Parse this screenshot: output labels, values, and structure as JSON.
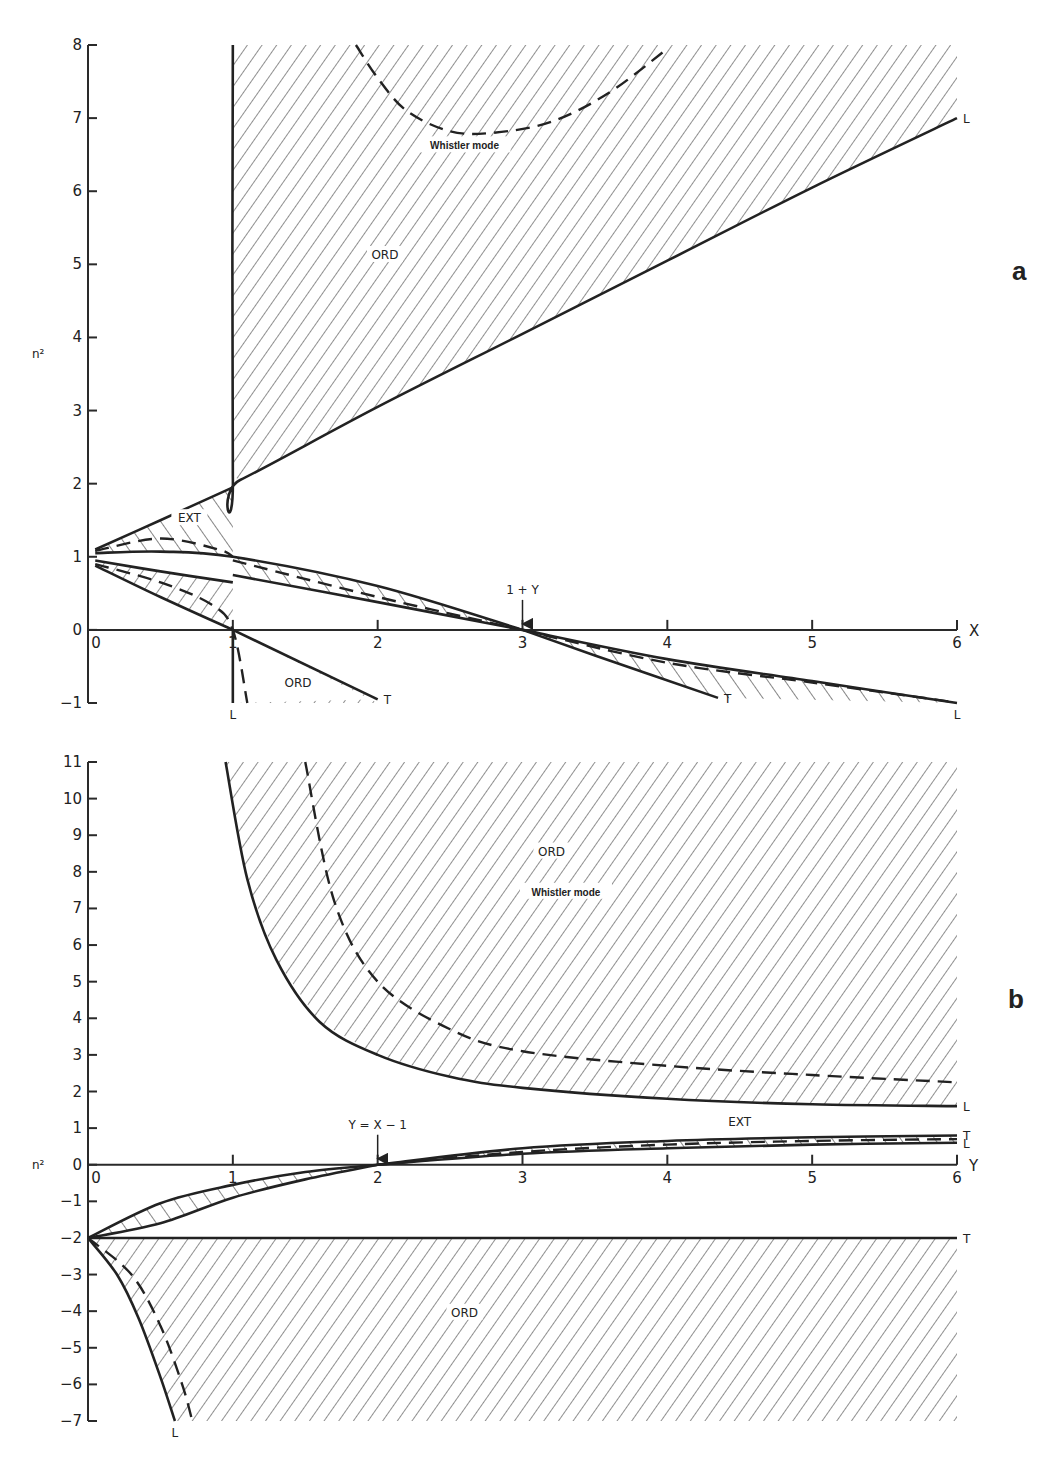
{
  "chart_data": [
    {
      "panel": "a",
      "type": "line",
      "xlabel": "X",
      "ylabel": "n²",
      "xlim": [
        0,
        6
      ],
      "ylim": [
        -1,
        8
      ],
      "x_ticks": [
        "0",
        "1",
        "2",
        "3",
        "4",
        "5",
        "6"
      ],
      "y_ticks": [
        "-1",
        "0",
        "1",
        "2",
        "3",
        "4",
        "5",
        "6",
        "7",
        "8"
      ],
      "grid": false,
      "annotations": [
        {
          "text": "1+Y",
          "x": 3,
          "y": 0,
          "arrow": true
        },
        {
          "text": "Whistler mode",
          "x": 2.6,
          "y": 6.6
        },
        {
          "text": "ORD",
          "x": 2.05,
          "y": 5.1
        },
        {
          "text": "EXT",
          "x": 0.7,
          "y": 1.5
        },
        {
          "text": "ORD",
          "x": 1.45,
          "y": -0.75
        }
      ],
      "series": [
        {
          "name": "ORD whistler lower boundary (L)",
          "style": "solid",
          "end_label": "L",
          "x": [
            1.0,
            1.0,
            1.05,
            2,
            3,
            4,
            5,
            6
          ],
          "y": [
            8,
            2.1,
            2.05,
            3.05,
            4.05,
            5.05,
            6.05,
            7.0
          ]
        },
        {
          "name": "ORD whistler dashed",
          "style": "dashed",
          "x": [
            1.85,
            2.0,
            2.2,
            2.5,
            2.8,
            3.2,
            3.6,
            4.0
          ],
          "y": [
            8.0,
            7.55,
            7.1,
            6.82,
            6.8,
            6.95,
            7.35,
            7.95
          ]
        },
        {
          "name": "EXT upper (X<1)",
          "style": "solid",
          "x": [
            0.05,
            0.5,
            1.0
          ],
          "y": [
            1.1,
            1.5,
            1.95
          ]
        },
        {
          "name": "EXT dashed (X<1)",
          "style": "dashed",
          "x": [
            0.05,
            0.5,
            0.9,
            1.0
          ],
          "y": [
            1.08,
            1.25,
            1.1,
            1.0
          ]
        },
        {
          "name": "Upper branch solid lower",
          "style": "solid",
          "x": [
            0.05,
            0.5,
            1.0,
            2.0,
            3.0
          ],
          "y": [
            1.05,
            1.07,
            1.0,
            0.6,
            0.0
          ]
        },
        {
          "name": "Upper branch dashed",
          "style": "dashed",
          "x": [
            1.0,
            2.0,
            3.0
          ],
          "y": [
            0.95,
            0.45,
            0.0
          ]
        },
        {
          "name": "Lower branch solid (X<1)",
          "style": "solid",
          "x": [
            0.05,
            0.5,
            1.0
          ],
          "y": [
            0.95,
            0.8,
            0.65
          ]
        },
        {
          "name": "Lower solid after X=1",
          "style": "solid",
          "x": [
            1.0,
            2.0,
            3.0
          ],
          "y": [
            0.75,
            0.38,
            0.0
          ]
        },
        {
          "name": "ORD lower branch solid",
          "style": "solid",
          "x": [
            0.05,
            0.5,
            1.0
          ],
          "y": [
            0.88,
            0.45,
            0.0
          ]
        },
        {
          "name": "ORD lower dashed",
          "style": "dashed",
          "x": [
            0.05,
            0.5,
            0.85,
            1.0,
            1.1
          ],
          "y": [
            0.9,
            0.65,
            0.35,
            0.0,
            -1.0
          ]
        },
        {
          "name": "ORD X>1 (T)",
          "style": "solid",
          "end_label": "T",
          "x": [
            1.0,
            2.0
          ],
          "y": [
            0.0,
            -0.95
          ]
        },
        {
          "name": "Vertical L at X=1",
          "style": "solid",
          "end_label": "L",
          "x": [
            1.0,
            1.0
          ],
          "y": [
            0.0,
            -1.0
          ]
        },
        {
          "name": "EXT X>3 upper (L)",
          "style": "solid",
          "end_label": "L",
          "x": [
            3.0,
            4.0,
            5.0,
            6.0
          ],
          "y": [
            0.0,
            -0.4,
            -0.7,
            -1.0
          ]
        },
        {
          "name": "EXT X>3 dashed",
          "style": "dashed",
          "x": [
            3.0,
            4.0,
            5.0,
            5.95
          ],
          "y": [
            0.0,
            -0.45,
            -0.72,
            -0.98
          ]
        },
        {
          "name": "EXT X>3 lower (T)",
          "style": "solid",
          "end_label": "T",
          "x": [
            3.0,
            3.5,
            4.35
          ],
          "y": [
            0.0,
            -0.35,
            -0.93
          ]
        }
      ]
    },
    {
      "panel": "b",
      "type": "line",
      "xlabel": "Y",
      "ylabel": "n²",
      "xlim": [
        0,
        6
      ],
      "ylim": [
        -7,
        11
      ],
      "x_ticks": [
        "0",
        "1",
        "2",
        "3",
        "4",
        "5",
        "6"
      ],
      "y_ticks": [
        "-7",
        "-6",
        "-5",
        "-4",
        "-3",
        "-2",
        "-1",
        "0",
        "1",
        "2",
        "3",
        "4",
        "5",
        "6",
        "7",
        "8",
        "9",
        "10",
        "11"
      ],
      "grid": false,
      "annotations": [
        {
          "text": "Y=X-1",
          "x": 2,
          "y": 0,
          "arrow": true
        },
        {
          "text": "ORD",
          "x": 3.2,
          "y": 8.5
        },
        {
          "text": "Whistler mode",
          "x": 3.3,
          "y": 7.4
        },
        {
          "text": "EXT",
          "x": 4.5,
          "y": 1.1
        },
        {
          "text": "ORD",
          "x": 2.6,
          "y": -4.1
        }
      ],
      "series": [
        {
          "name": "ORD whistler solid (L)",
          "style": "solid",
          "end_label": "L",
          "x": [
            0.95,
            1.1,
            1.3,
            1.6,
            2.0,
            2.5,
            3.0,
            4.0,
            5.0,
            6.0
          ],
          "y": [
            11,
            7.8,
            5.6,
            3.9,
            3.0,
            2.4,
            2.1,
            1.8,
            1.65,
            1.6
          ]
        },
        {
          "name": "ORD whistler dashed",
          "style": "dashed",
          "x": [
            1.5,
            1.7,
            2.0,
            2.5,
            3.0,
            4.0,
            5.0,
            6.0
          ],
          "y": [
            11,
            7.2,
            5.0,
            3.7,
            3.1,
            2.7,
            2.45,
            2.25
          ]
        },
        {
          "name": "EXT upper (T)",
          "style": "solid",
          "end_label": "T",
          "x": [
            2.0,
            3.0,
            4.0,
            5.0,
            6.0
          ],
          "y": [
            0.0,
            0.45,
            0.65,
            0.75,
            0.8
          ]
        },
        {
          "name": "EXT dashed",
          "style": "dashed",
          "x": [
            2.0,
            3.0,
            4.0,
            5.0,
            6.0
          ],
          "y": [
            0.0,
            0.35,
            0.55,
            0.65,
            0.7
          ]
        },
        {
          "name": "EXT lower (L)",
          "style": "solid",
          "end_label": "L",
          "x": [
            2.0,
            3.0,
            4.0,
            5.0,
            6.0
          ],
          "y": [
            0.0,
            0.3,
            0.45,
            0.55,
            0.6
          ]
        },
        {
          "name": "Y<2 upper solid",
          "style": "solid",
          "x": [
            0.0,
            0.5,
            1.0,
            1.5,
            2.0
          ],
          "y": [
            -2.0,
            -1.05,
            -0.55,
            -0.2,
            0.0
          ]
        },
        {
          "name": "Y<2 lower solid",
          "style": "solid",
          "x": [
            0.0,
            0.5,
            1.0,
            1.5,
            2.0
          ],
          "y": [
            -2.0,
            -1.6,
            -0.9,
            -0.4,
            0.0
          ]
        },
        {
          "name": "ORD lower boundary (T)",
          "style": "solid",
          "end_label": "T",
          "x": [
            0.0,
            6.0
          ],
          "y": [
            -2.0,
            -2.0
          ]
        },
        {
          "name": "ORD negative branch (L)",
          "style": "solid",
          "end_label": "L",
          "x": [
            0.0,
            0.2,
            0.35,
            0.5,
            0.6
          ],
          "y": [
            -2.0,
            -3.0,
            -4.2,
            -5.8,
            -7.0
          ]
        },
        {
          "name": "ORD negative dashed",
          "style": "dashed",
          "x": [
            0.0,
            0.3,
            0.5,
            0.65,
            0.72
          ],
          "y": [
            -2.0,
            -3.0,
            -4.4,
            -6.0,
            -7.0
          ]
        }
      ]
    }
  ],
  "figure": {
    "panel_a_label": "a",
    "panel_b_label": "b",
    "ylabel_a": "n²",
    "ylabel_b": "n²",
    "xlabel_a": "X",
    "xlabel_b": "Y",
    "ink_color": "#222222"
  }
}
